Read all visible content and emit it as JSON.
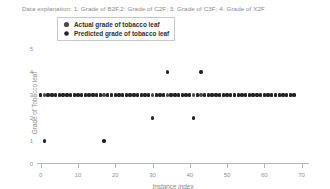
{
  "explanation": "Data explanation: 1: Grade of B2F,2: Grade of C2F; 3: Grade of C3F; 4: Grade of X2F",
  "legend": {
    "position": "upper-left-inside",
    "entries": [
      {
        "label": "Actual grade of tobacco leaf",
        "marker": "filled-circle-marker",
        "color": "#4a4a4a"
      },
      {
        "label": "Predicted grade of tobacco leaf",
        "marker": "filled-circle-marker",
        "color": "#232323"
      }
    ]
  },
  "chart_data": {
    "type": "scatter",
    "title": "",
    "xlabel": "Instance index",
    "ylabel": "Grade of Tobacco leaf",
    "xlim": [
      -1,
      72
    ],
    "ylim": [
      0,
      5.3
    ],
    "xticks": [
      0,
      10,
      20,
      30,
      40,
      50,
      60,
      70
    ],
    "yticks": [
      0,
      1,
      2,
      3,
      4,
      5
    ],
    "grid": false,
    "series": [
      {
        "name": "Actual grade of tobacco leaf",
        "color": "#4a4a4a",
        "x": [
          0,
          1,
          2,
          3,
          4,
          5,
          6,
          7,
          8,
          9,
          10,
          11,
          12,
          13,
          14,
          15,
          16,
          17,
          18,
          19,
          20,
          21,
          22,
          23,
          24,
          25,
          26,
          27,
          28,
          29,
          30,
          31,
          32,
          33,
          34,
          35,
          36,
          37,
          38,
          39,
          40,
          41,
          42,
          43,
          44,
          45,
          46,
          47,
          48,
          49,
          50,
          51,
          52,
          53,
          54,
          55,
          56,
          57,
          58,
          59,
          60,
          61,
          62,
          63,
          64,
          65,
          66,
          67,
          68
        ],
        "y": [
          3,
          3,
          3,
          3,
          3,
          3,
          3,
          3,
          3,
          3,
          3,
          3,
          3,
          3,
          3,
          3,
          3,
          3,
          3,
          3,
          3,
          3,
          3,
          3,
          3,
          3,
          3,
          3,
          3,
          3,
          3,
          3,
          3,
          3,
          3,
          3,
          3,
          3,
          3,
          3,
          3,
          3,
          3,
          3,
          3,
          3,
          3,
          3,
          3,
          3,
          3,
          3,
          3,
          3,
          3,
          3,
          3,
          3,
          3,
          3,
          3,
          3,
          3,
          3,
          3,
          3,
          3,
          3,
          3
        ]
      },
      {
        "name": "Predicted grade of tobacco leaf",
        "color": "#232323",
        "x": [
          0,
          1,
          2,
          3,
          4,
          5,
          6,
          7,
          8,
          9,
          10,
          11,
          12,
          13,
          14,
          15,
          16,
          17,
          18,
          19,
          20,
          21,
          22,
          23,
          24,
          25,
          26,
          27,
          28,
          29,
          30,
          31,
          32,
          33,
          34,
          35,
          36,
          37,
          38,
          39,
          40,
          41,
          42,
          43,
          44,
          45,
          46,
          47,
          48,
          49,
          50,
          51,
          52,
          53,
          54,
          55,
          56,
          57,
          58,
          59,
          60,
          61,
          62,
          63,
          64,
          65,
          66,
          67,
          68
        ],
        "y": [
          3,
          1,
          3,
          3,
          3,
          3,
          3,
          3,
          3,
          3,
          3,
          3,
          3,
          3,
          3,
          3,
          3,
          1,
          3,
          3,
          3,
          3,
          3,
          3,
          3,
          3,
          3,
          3,
          3,
          3,
          2,
          3,
          3,
          3,
          4,
          3,
          3,
          3,
          3,
          3,
          3,
          2,
          3,
          4,
          3,
          3,
          3,
          3,
          3,
          3,
          3,
          3,
          3,
          3,
          3,
          3,
          3,
          3,
          3,
          3,
          3,
          3,
          3,
          3,
          3,
          3,
          3,
          3,
          3
        ]
      }
    ],
    "mismatched_points": [
      {
        "index": 1,
        "actual": 3,
        "predicted": 1
      },
      {
        "index": 17,
        "actual": 3,
        "predicted": 1
      },
      {
        "index": 30,
        "actual": 3,
        "predicted": 2
      },
      {
        "index": 34,
        "actual": 3,
        "predicted": 4
      },
      {
        "index": 41,
        "actual": 3,
        "predicted": 2
      },
      {
        "index": 43,
        "actual": 3,
        "predicted": 4
      }
    ]
  }
}
